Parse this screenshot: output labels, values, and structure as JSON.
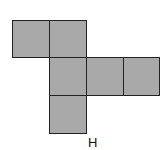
{
  "diagram": {
    "type": "cube-net",
    "fill_color": "#a9a9a9",
    "border_color": "#222222",
    "label": "H",
    "squares": [
      {
        "x": 12,
        "y": 20,
        "w": 38,
        "h": 38
      },
      {
        "x": 49,
        "y": 20,
        "w": 38,
        "h": 38
      },
      {
        "x": 49,
        "y": 57,
        "w": 38,
        "h": 39
      },
      {
        "x": 86,
        "y": 57,
        "w": 38,
        "h": 39
      },
      {
        "x": 123,
        "y": 57,
        "w": 37,
        "h": 39
      },
      {
        "x": 49,
        "y": 95,
        "w": 38,
        "h": 39
      }
    ]
  }
}
